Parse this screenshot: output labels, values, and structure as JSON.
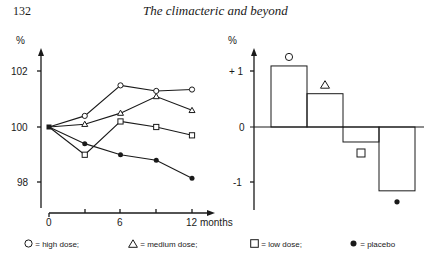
{
  "header": {
    "page_number": "132",
    "running_head": "The climacteric and beyond"
  },
  "chart_data": [
    {
      "type": "line",
      "title": "",
      "xlabel": "months",
      "ylabel": "%",
      "x": [
        0,
        3,
        6,
        9,
        12
      ],
      "x_tick_labels": [
        "0",
        "6",
        "12 months"
      ],
      "y_tick_labels": [
        "102",
        "100",
        "98"
      ],
      "ylim": [
        97.1,
        102.5
      ],
      "grid": false,
      "series": [
        {
          "name": "high dose",
          "marker": "open-circle",
          "values": [
            100,
            100.4,
            101.5,
            101.3,
            101.35
          ]
        },
        {
          "name": "medium dose",
          "marker": "open-triangle",
          "values": [
            100,
            100.1,
            100.5,
            101.1,
            100.6
          ]
        },
        {
          "name": "low dose",
          "marker": "open-square",
          "values": [
            100,
            99.0,
            100.2,
            100.0,
            99.7
          ]
        },
        {
          "name": "placebo",
          "marker": "filled-circle",
          "values": [
            100,
            99.4,
            99.0,
            98.8,
            98.15
          ]
        }
      ]
    },
    {
      "type": "bar",
      "title": "",
      "xlabel": "",
      "ylabel": "%",
      "categories": [
        "high dose",
        "medium dose",
        "low dose",
        "placebo"
      ],
      "markers": [
        "open-circle",
        "open-triangle",
        "open-square",
        "filled-circle"
      ],
      "values": [
        1.1,
        0.6,
        -0.27,
        -1.15
      ],
      "y_tick_labels": [
        "+ 1",
        "0",
        "-1"
      ],
      "ylim": [
        -1.5,
        1.3
      ],
      "grid": false
    }
  ],
  "left_axis": {
    "unit": "%",
    "ticks": [
      "102",
      "100",
      "98"
    ],
    "x_ticks": [
      "0",
      "6",
      "12 months"
    ]
  },
  "right_axis": {
    "unit": "%",
    "ticks": [
      "+ 1",
      "0",
      "-1"
    ]
  },
  "legend": [
    {
      "symbol": "open-circle",
      "label": "= high dose;"
    },
    {
      "symbol": "open-triangle",
      "label": "= medium dose;"
    },
    {
      "symbol": "open-square",
      "label": "= low dose;"
    },
    {
      "symbol": "filled-circle",
      "label": "= placebo"
    }
  ]
}
